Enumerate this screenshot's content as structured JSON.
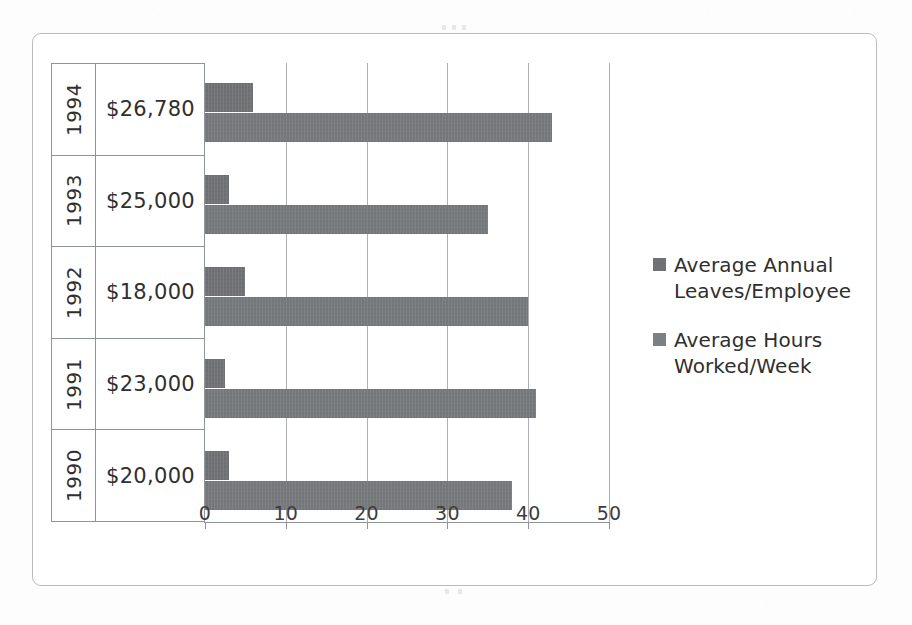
{
  "chart_data": {
    "type": "bar",
    "orientation": "horizontal",
    "title": "",
    "subtitle": "",
    "xlabel": "",
    "ylabel": "",
    "xlim": [
      0,
      50
    ],
    "xticks": [
      "0",
      "10",
      "20",
      "30",
      "40",
      "50"
    ],
    "xtick_values": [
      0,
      10,
      20,
      30,
      40,
      50
    ],
    "grid": true,
    "legend_position": "right",
    "categories": [
      "1990",
      "1991",
      "1992",
      "1993",
      "1994"
    ],
    "category_level2": [
      "$20,000",
      "$23,000",
      "$18,000",
      "$25,000",
      "$26,780"
    ],
    "category_order_top_to_bottom": [
      "1994",
      "1993",
      "1992",
      "1991",
      "1990"
    ],
    "series": [
      {
        "name": "Average Annual Leaves/Employee",
        "color": "#6f7174",
        "values": [
          3,
          2.5,
          5,
          3,
          6
        ],
        "values_top_to_bottom": [
          6,
          3,
          5,
          2.5,
          3
        ]
      },
      {
        "name": "Average Hours Worked/Week",
        "color": "#76797c",
        "values": [
          38,
          41,
          40,
          35,
          43
        ],
        "values_top_to_bottom": [
          43,
          35,
          40,
          41,
          38
        ]
      }
    ],
    "rows": [
      {
        "year": "1994",
        "salary": "$26,780",
        "leaves": 6,
        "hours": 43
      },
      {
        "year": "1993",
        "salary": "$25,000",
        "leaves": 3,
        "hours": 35
      },
      {
        "year": "1992",
        "salary": "$18,000",
        "leaves": 5,
        "hours": 40
      },
      {
        "year": "1991",
        "salary": "$23,000",
        "leaves": 2.5,
        "hours": 41
      },
      {
        "year": "1990",
        "salary": "$20,000",
        "leaves": 3,
        "hours": 38
      }
    ]
  },
  "legend": {
    "items": [
      {
        "label_line1": "Average Annual",
        "label_line2": "Leaves/Employee",
        "swatch_color": "#6f7174"
      },
      {
        "label_line1": "Average Hours",
        "label_line2": "Worked/Week",
        "swatch_color": "#7d8083"
      }
    ]
  },
  "axis": {
    "tick_labels": [
      "0",
      "10",
      "20",
      "30",
      "40",
      "50"
    ]
  },
  "frame": {
    "border_color": "#b9bcbe",
    "background": "#ffffff"
  }
}
